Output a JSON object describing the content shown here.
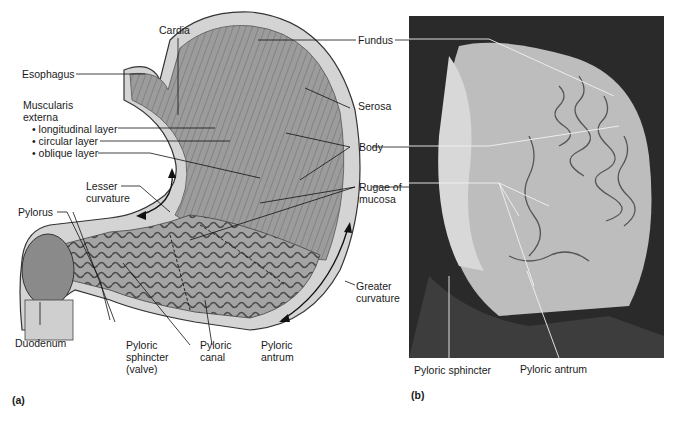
{
  "figure": {
    "panel_a": {
      "tag": "(a)",
      "labels": {
        "cardia": "Cardia",
        "esophagus": "Esophagus",
        "muscularis_line1": "Muscularis",
        "muscularis_line2": "externa",
        "longitudinal": "• longitudinal layer",
        "circular": "• circular layer",
        "oblique": "• oblique layer",
        "lesser_line1": "Lesser",
        "lesser_line2": "curvature",
        "pylorus": "Pylorus",
        "duodenum": "Duodenum",
        "pyloric_sphincter_line1": "Pyloric",
        "pyloric_sphincter_line2": "sphincter",
        "pyloric_sphincter_line3": "(valve)",
        "pyloric_canal_line1": "Pyloric",
        "pyloric_canal_line2": "canal",
        "pyloric_antrum_line1": "Pyloric",
        "pyloric_antrum_line2": "antrum",
        "fundus": "Fundus",
        "serosa": "Serosa",
        "body": "Body",
        "rugae_line1": "Rugae of",
        "rugae_line2": "mucosa",
        "greater_line1": "Greater",
        "greater_line2": "curvature"
      }
    },
    "panel_b": {
      "tag": "(b)",
      "labels": {
        "pyloric_sphincter": "Pyloric sphincter",
        "pyloric_antrum": "Pyloric antrum"
      }
    },
    "colors": {
      "ink": "#1a1a1a",
      "illustration_mid": "#9a9a9a",
      "illustration_dark": "#5a5a5a",
      "photo_bg": "#2a2a2a",
      "photo_light": "#c8c8c8"
    }
  }
}
